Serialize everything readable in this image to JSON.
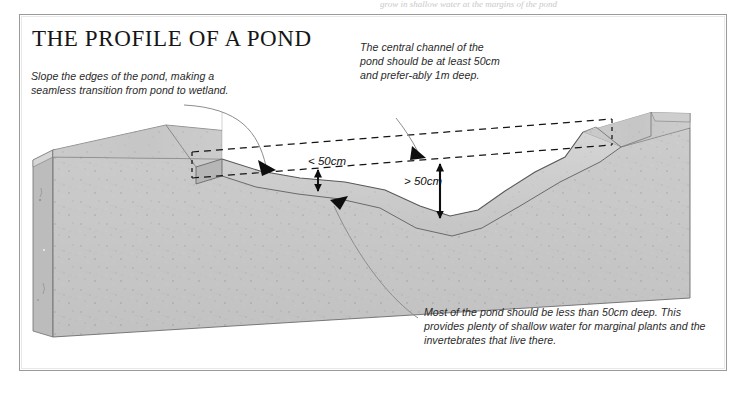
{
  "page": {
    "top_cut_text": "grow in shallow water at the margins of the pond",
    "frame_color": "#9a9a9a",
    "background": "#ffffff"
  },
  "title": "THE PROFILE OF A POND",
  "callouts": [
    {
      "name": "slope-edges",
      "text": "Slope the edges of the pond, making a seamless transition from pond to wetland."
    },
    {
      "name": "central-channel",
      "text": "The central channel of the pond should be at least 50cm and prefer-ably 1m deep."
    },
    {
      "name": "shallow-water",
      "text": "Most of the pond should be less than 50cm deep. This provides plenty of shallow water for marginal plants and the invertebrates that live there."
    }
  ],
  "measurements": [
    {
      "name": "shallow-depth",
      "label": "< 50cm"
    },
    {
      "name": "channel-depth",
      "label": "> 50cm"
    }
  ],
  "illustration": {
    "name": "pond-cross-section-block",
    "description": "Cutaway soil block showing a pond profile with sloping shallow margins and a deeper central channel",
    "colors": {
      "soil_front": "#c6c6c6",
      "soil_top": "#bdbdbd",
      "soil_light": "#d8d8d8",
      "soil_dark": "#a9a9a9",
      "outline": "#5c5c5c",
      "dashed_guide": "#1a1a1a",
      "leader_line": "#8f8f8f"
    }
  }
}
